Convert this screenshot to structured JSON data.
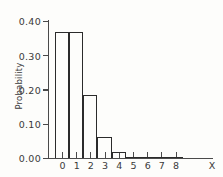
{
  "chart_data": {
    "type": "bar",
    "title": "",
    "subtitle": "",
    "xlabel": "X",
    "ylabel": "Probability",
    "categories": [
      "0",
      "1",
      "2",
      "3",
      "4",
      "5",
      "6",
      "7",
      "8"
    ],
    "values": [
      0.368,
      0.368,
      0.184,
      0.061,
      0.015,
      0.003,
      0.0,
      0.0,
      0.0
    ],
    "series": [
      {
        "name": "Probability",
        "values": [
          0.368,
          0.368,
          0.184,
          0.061,
          0.015,
          0.003,
          0.0,
          0.0,
          0.0
        ]
      }
    ],
    "x_tick_labels": [
      "0",
      "1",
      "2",
      "3",
      "4",
      "5",
      "6",
      "7",
      "8"
    ],
    "y_tick_labels": [
      "0.00",
      "0.10",
      "0.20",
      "0.30",
      "0.40"
    ],
    "y_tick_values": [
      0.0,
      0.1,
      0.2,
      0.3,
      0.4
    ],
    "xlim": [
      -0.5,
      8.5
    ],
    "ylim": [
      0.0,
      0.4
    ],
    "grid": false,
    "legend": false,
    "legend_position": "none",
    "bar_style": "outline",
    "bar_width": 1.0,
    "colors": {
      "bar_edge": "#2b2b2b",
      "axis": "#4a4a4a",
      "text": "#3a3a3a",
      "background": "#fdfdfb"
    },
    "annotations": []
  }
}
